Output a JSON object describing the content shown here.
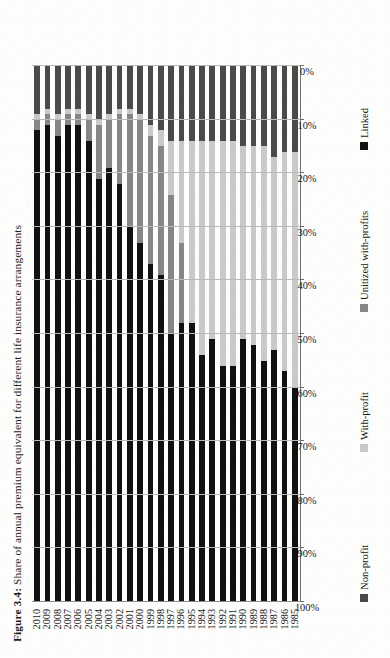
{
  "figure": {
    "label": "Figure 3.4:",
    "caption": "Share of annual premium equivalent for different life insurance arrangements"
  },
  "legend": {
    "position": "bottom",
    "items": [
      {
        "name": "Non-profit",
        "color": "#4a4a4a"
      },
      {
        "name": "With-profit",
        "color": "#c9c9c9"
      },
      {
        "name": "Unitized with-profits",
        "color": "#868686"
      },
      {
        "name": "Linked",
        "color": "#111111"
      }
    ]
  },
  "axis": {
    "x_ticks": [
      "100%",
      "90%",
      "80%",
      "70%",
      "60%",
      "50%",
      "40%",
      "30%",
      "20%",
      "10%",
      "0%"
    ],
    "x_direction": "descending-left-to-right",
    "grid": true
  },
  "chart_data": {
    "type": "bar",
    "orientation": "horizontal",
    "stacked": "percent",
    "title": "Share of annual premium equivalent for different life insurance arrangements",
    "xlabel": "",
    "ylabel": "",
    "xlim": [
      0,
      100
    ],
    "categories": [
      "1985",
      "1986",
      "1987",
      "1988",
      "1989",
      "1990",
      "1991",
      "1992",
      "1993",
      "1994",
      "1995",
      "1996",
      "1997",
      "1998",
      "1999",
      "2000",
      "2001",
      "2002",
      "2003",
      "2004",
      "2005",
      "2006",
      "2007",
      "2008",
      "2009",
      "2010"
    ],
    "series": [
      {
        "name": "Non-profit",
        "color": "#4a4a4a",
        "values": [
          16,
          16,
          17,
          15,
          15,
          15,
          14,
          14,
          14,
          14,
          14,
          14,
          14,
          12,
          11,
          9,
          8,
          8,
          9,
          10,
          9,
          8,
          8,
          9,
          8,
          9
        ]
      },
      {
        "name": "With-profit",
        "color": "#c9c9c9",
        "values": [
          44,
          41,
          36,
          40,
          37,
          36,
          42,
          42,
          37,
          40,
          34,
          19,
          10,
          3,
          2,
          1,
          1,
          1,
          1,
          1,
          1,
          1,
          1,
          1,
          1,
          1
        ]
      },
      {
        "name": "Unitized with-profits",
        "color": "#868686",
        "values": [
          0,
          0,
          0,
          0,
          0,
          0,
          0,
          0,
          0,
          0,
          0,
          15,
          26,
          24,
          24,
          23,
          21,
          13,
          9,
          10,
          4,
          2,
          2,
          3,
          2,
          2
        ]
      },
      {
        "name": "Linked",
        "color": "#111111",
        "values": [
          40,
          43,
          47,
          45,
          48,
          49,
          44,
          44,
          49,
          46,
          52,
          52,
          50,
          61,
          63,
          67,
          70,
          78,
          81,
          79,
          86,
          89,
          89,
          87,
          89,
          88
        ]
      }
    ]
  }
}
